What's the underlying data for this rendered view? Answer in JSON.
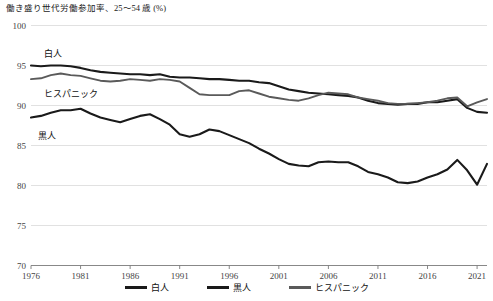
{
  "chart_data": {
    "type": "line",
    "title": "働き盛り世代労働参加率、25～54 歳 (%)",
    "xlabel": "",
    "ylabel": "",
    "ylim": [
      70,
      100
    ],
    "ytick_step": 5,
    "yticks": [
      "100",
      "95",
      "90",
      "85",
      "80",
      "75",
      "70"
    ],
    "xlim": [
      1976,
      2022
    ],
    "xticks": [
      "1976",
      "1981",
      "1986",
      "1991",
      "1996",
      "2001",
      "2006",
      "2011",
      "2016",
      "2021"
    ],
    "grid": true,
    "legend_position": "bottom",
    "x": [
      1976,
      1977,
      1978,
      1979,
      1980,
      1981,
      1982,
      1983,
      1984,
      1985,
      1986,
      1987,
      1988,
      1989,
      1990,
      1991,
      1992,
      1993,
      1994,
      1995,
      1996,
      1997,
      1998,
      1999,
      2000,
      2001,
      2002,
      2003,
      2004,
      2005,
      2006,
      2007,
      2008,
      2009,
      2010,
      2011,
      2012,
      2013,
      2014,
      2015,
      2016,
      2017,
      2018,
      2019,
      2020,
      2021,
      2022
    ],
    "series": [
      {
        "name": "白人",
        "color": "#1a1a1a",
        "inline_label": "白人",
        "values": [
          95.0,
          94.9,
          95.0,
          95.0,
          94.9,
          94.7,
          94.4,
          94.2,
          94.1,
          94.0,
          93.9,
          93.9,
          93.8,
          93.9,
          93.6,
          93.5,
          93.5,
          93.4,
          93.3,
          93.3,
          93.2,
          93.1,
          93.1,
          92.9,
          92.8,
          92.4,
          92.0,
          91.8,
          91.6,
          91.5,
          91.4,
          91.3,
          91.2,
          91.0,
          90.6,
          90.3,
          90.2,
          90.1,
          90.2,
          90.2,
          90.4,
          90.4,
          90.6,
          90.8,
          89.7,
          89.2,
          89.1
        ]
      },
      {
        "name": "黒人",
        "color": "#1a1a1a",
        "inline_label": "黒人",
        "values": [
          88.5,
          88.7,
          89.1,
          89.4,
          89.4,
          89.6,
          89.0,
          88.5,
          88.2,
          87.9,
          88.3,
          88.7,
          88.9,
          88.3,
          87.6,
          86.4,
          86.1,
          86.4,
          87.0,
          86.8,
          86.3,
          85.8,
          85.3,
          84.6,
          84.0,
          83.3,
          82.7,
          82.5,
          82.4,
          82.9,
          83.0,
          82.9,
          82.9,
          82.4,
          81.7,
          81.4,
          81.0,
          80.4,
          80.3,
          80.5,
          81.0,
          81.4,
          82.0,
          83.2,
          81.9,
          80.1,
          82.7
        ]
      },
      {
        "name": "ヒスパニック",
        "color": "#5a5a5a",
        "inline_label": "ヒスパニック",
        "values": [
          93.3,
          93.4,
          93.8,
          94.0,
          93.8,
          93.7,
          93.4,
          93.1,
          93.0,
          93.1,
          93.3,
          93.2,
          93.1,
          93.3,
          93.2,
          93.0,
          92.2,
          91.4,
          91.3,
          91.3,
          91.3,
          91.8,
          91.9,
          91.5,
          91.1,
          90.9,
          90.7,
          90.6,
          90.9,
          91.3,
          91.6,
          91.5,
          91.4,
          91.0,
          90.8,
          90.6,
          90.3,
          90.2,
          90.2,
          90.3,
          90.4,
          90.6,
          90.9,
          91.0,
          89.9,
          90.4,
          90.8
        ]
      }
    ]
  },
  "legend": {
    "items": [
      {
        "label": "白人"
      },
      {
        "label": "黒人"
      },
      {
        "label": "ヒスパニック"
      }
    ]
  },
  "inline_labels": {
    "white": "白人",
    "hispanic": "ヒスパニック",
    "black": "黒人"
  }
}
